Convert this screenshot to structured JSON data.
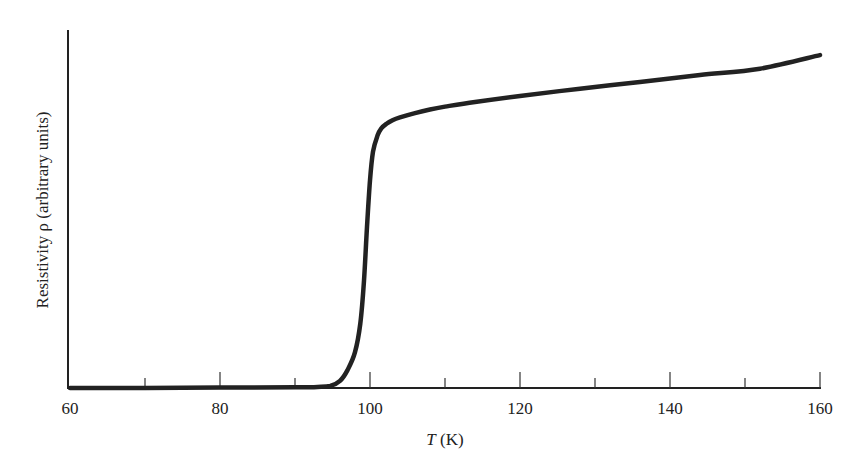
{
  "chart_data": {
    "type": "line",
    "title": "",
    "xlabel_italic": "T",
    "xlabel_rest": " (K)",
    "xlabel": "T (K)",
    "ylabel": "Resistivity ρ (arbitrary units)",
    "xlim": [
      60,
      160
    ],
    "ylim": [
      0,
      100
    ],
    "x_major_ticks": [
      60,
      80,
      100,
      120,
      140,
      160
    ],
    "x_minor_ticks": [
      70,
      90,
      110,
      130,
      150
    ],
    "y_ticks": [],
    "grid": false,
    "legend": null,
    "series": [
      {
        "name": "Resistivity",
        "color": "#222222",
        "x": [
          60,
          70,
          80,
          90,
          93,
          94.7,
          96,
          97,
          98,
          98.7,
          99.2,
          99.6,
          100,
          100.4,
          101,
          101.5,
          102.2,
          103,
          104,
          106,
          108,
          110,
          114,
          120,
          128,
          136,
          144,
          152,
          160
        ],
        "y": [
          0,
          0,
          0.1,
          0.2,
          0.3,
          0.6,
          2,
          5,
          10,
          18,
          30,
          45,
          58,
          66,
          70.5,
          72.5,
          73.8,
          74.8,
          75.6,
          76.8,
          77.8,
          78.6,
          79.9,
          81.6,
          83.6,
          85.5,
          87.4,
          89.2,
          93
        ]
      }
    ]
  },
  "plot_area": {
    "x0_px": 70,
    "x1_px": 820,
    "y0_px": 388,
    "ytop_px": 30
  }
}
